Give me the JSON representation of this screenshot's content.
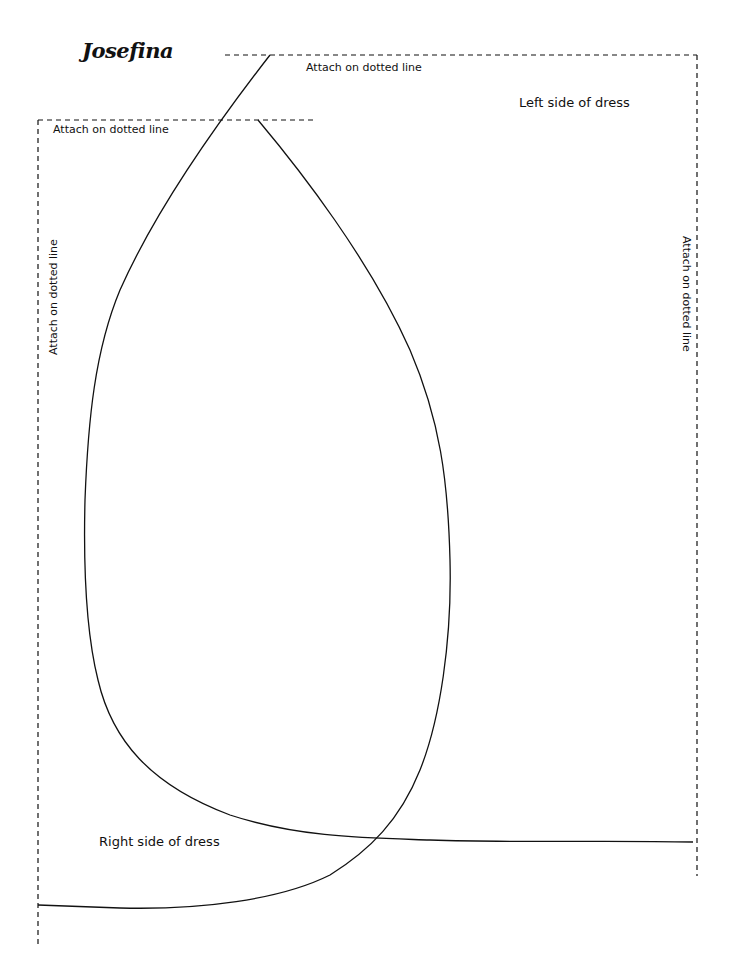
{
  "document": {
    "title": "Josefina",
    "type": "Paper doll dress cut-out template"
  },
  "labels": {
    "attach_top_right": "Attach on dotted line",
    "attach_top_left": "Attach on dotted line",
    "attach_left_vertical": "Attach on dotted line",
    "attach_right_vertical": "Attach on dotted line",
    "left_side": "Left side of dress",
    "right_side": "Right side of dress"
  },
  "colors": {
    "background": "#ffffff",
    "ink": "#111111"
  }
}
